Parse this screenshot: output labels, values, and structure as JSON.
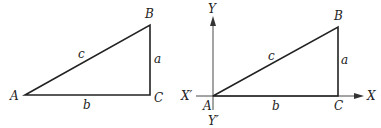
{
  "figures": [
    {
      "name": "right-triangle",
      "vertices": {
        "A": "A",
        "B": "B",
        "C": "C"
      },
      "sides": {
        "a": "a",
        "b": "b",
        "c": "c"
      }
    },
    {
      "name": "right-triangle-on-axes",
      "vertices": {
        "A": "A",
        "B": "B",
        "C": "C"
      },
      "sides": {
        "a": "a",
        "b": "b",
        "c": "c"
      },
      "axes": {
        "x_pos": "X",
        "x_neg": "X′",
        "y_pos": "Y",
        "y_neg": "Y′"
      }
    }
  ],
  "colors": {
    "stroke": "#222222",
    "background": "#ffffff"
  }
}
